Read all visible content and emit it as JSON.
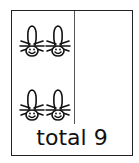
{
  "card": {
    "left_column": {
      "creatures": [
        {
          "icon": "octopus-creature-icon",
          "row": 1,
          "col": 1
        },
        {
          "icon": "octopus-creature-icon",
          "row": 1,
          "col": 2
        },
        {
          "icon": "octopus-creature-icon",
          "row": 2,
          "col": 1
        },
        {
          "icon": "octopus-creature-icon",
          "row": 2,
          "col": 2
        }
      ]
    },
    "right_column": {
      "creatures": []
    },
    "total_label": "total 9"
  },
  "colors": {
    "stroke": "#111111",
    "background": "#ffffff"
  }
}
